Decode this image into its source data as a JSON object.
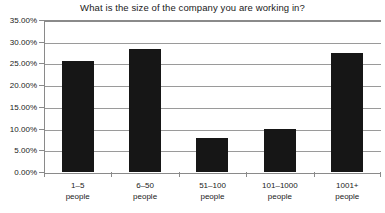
{
  "chart_data": {
    "type": "bar",
    "title": "What is the size of the company you are working in?",
    "xlabel": "",
    "ylabel": "",
    "categories": [
      "1–5 people",
      "6–50 people",
      "51–100 people",
      "101–1000 people",
      "1001+ people"
    ],
    "category_lines": [
      {
        "line1": "1–5",
        "line2": "people"
      },
      {
        "line1": "6–50",
        "line2": "people"
      },
      {
        "line1": "51–100",
        "line2": "people"
      },
      {
        "line1": "101–1000",
        "line2": "people"
      },
      {
        "line1": "1001+",
        "line2": "people"
      }
    ],
    "values": [
      25.5,
      28.4,
      7.8,
      9.9,
      27.4
    ],
    "value_labels": [
      "25.50%",
      "28.40%",
      "7.80%",
      "9.90%",
      "27.40%"
    ],
    "ylim": [
      0,
      35
    ],
    "ytick_values": [
      0,
      5,
      10,
      15,
      20,
      25,
      30,
      35
    ],
    "ytick_labels": [
      "0.00%",
      "5.00%",
      "10.00%",
      "15.00%",
      "20.00%",
      "25.00%",
      "30.00%",
      "35.00%"
    ],
    "grid": true,
    "grid_axis": "y",
    "legend": false,
    "legend_position": "none",
    "bar_color": "#161616",
    "grid_color": "#9a9a9a",
    "axis_color": "#8a8a8a",
    "text_color": "#1a1a1a",
    "background_color": "#ffffff"
  }
}
